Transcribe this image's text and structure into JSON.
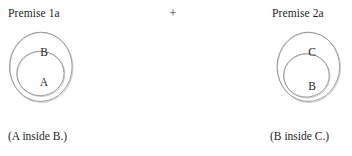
{
  "headings": {
    "left": "Premise 1a",
    "right": "Premise 2a"
  },
  "connector": {
    "symbol": "+"
  },
  "captions": {
    "left": "(A inside B.)",
    "right": "(B inside C.)"
  },
  "diagrams": [
    {
      "id": "premise-1a",
      "outer_label": "B",
      "inner_label": "A",
      "caption": "(A inside B.)",
      "relation": "A inside B"
    },
    {
      "id": "premise-2a",
      "outer_label": "C",
      "inner_label": "B",
      "caption": "(B inside C.)",
      "relation": "B inside C"
    }
  ],
  "colors": {
    "stroke": "#8c8c8c",
    "stroke_light": "#b5b5b5",
    "text": "#1f1f1f",
    "background": "#ffffff"
  }
}
